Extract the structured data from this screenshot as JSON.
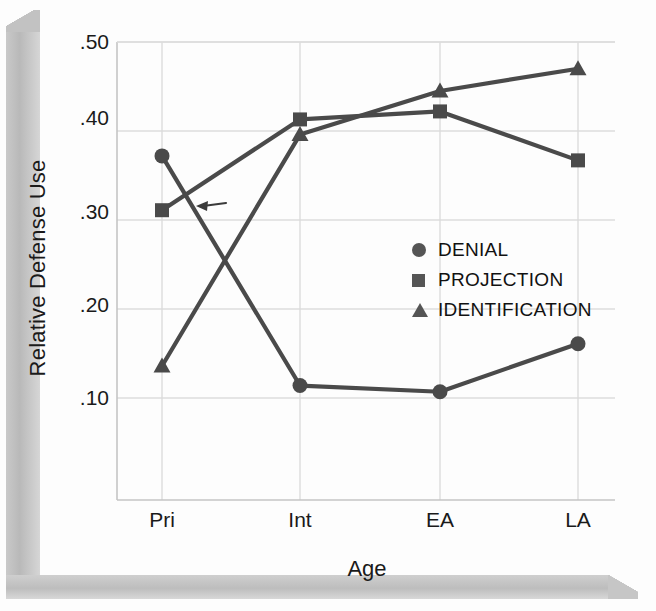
{
  "figure": {
    "ylabel": "Relative Defense Use",
    "xlabel": "Age",
    "annotation_arrow": "left-arrow-annotation"
  },
  "legend": {
    "items": [
      {
        "label": "DENIAL",
        "glyph": "circle-icon"
      },
      {
        "label": "PROJECTION",
        "glyph": "square-icon"
      },
      {
        "label": "IDENTIFICATION",
        "glyph": "triangle-icon"
      }
    ]
  },
  "chart_data": {
    "type": "line",
    "title": "",
    "xlabel": "Age",
    "ylabel": "Relative Defense Use",
    "categories": [
      "Pri",
      "Int",
      "EA",
      "LA"
    ],
    "yticks": [
      ".10",
      ".20",
      ".30",
      ".40",
      ".50"
    ],
    "ytick_values": [
      0.1,
      0.2,
      0.3,
      0.4,
      0.5
    ],
    "ylim": [
      0.05,
      0.5
    ],
    "grid": true,
    "legend_position": "center-right",
    "series": [
      {
        "name": "DENIAL",
        "marker": "circle",
        "values": [
          0.372,
          0.114,
          0.107,
          0.161
        ]
      },
      {
        "name": "PROJECTION",
        "marker": "square",
        "values": [
          0.311,
          0.413,
          0.422,
          0.367
        ]
      },
      {
        "name": "IDENTIFICATION",
        "marker": "triangle",
        "values": [
          0.136,
          0.396,
          0.445,
          0.47
        ]
      }
    ],
    "annotations": [
      {
        "type": "arrow",
        "direction": "left",
        "x": 0.0,
        "y": 0.0
      }
    ]
  }
}
